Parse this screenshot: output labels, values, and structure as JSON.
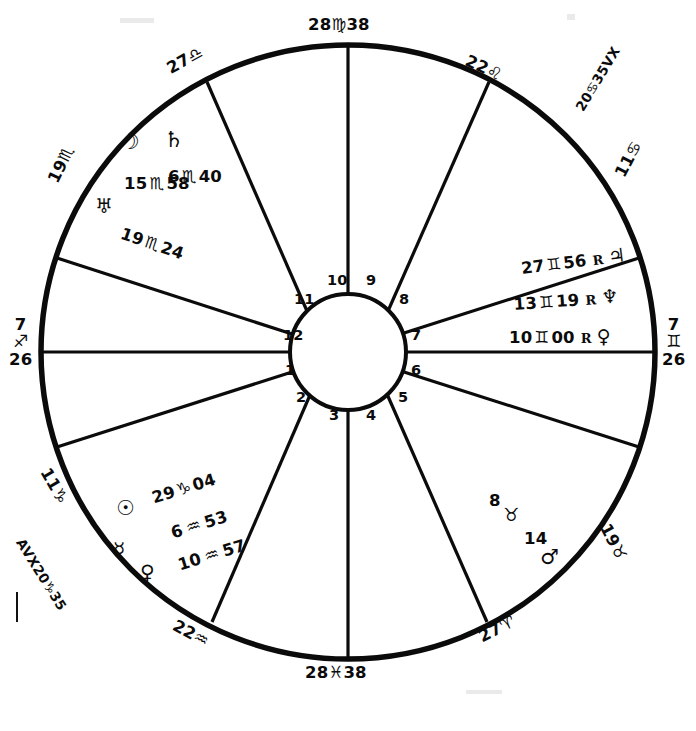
{
  "chart": {
    "type": "astrological-chart",
    "cusps": {
      "mc": {
        "text": "28♏38",
        "degree": "28",
        "sign": "♍",
        "minute": "38",
        "name": "midheaven"
      },
      "ic": {
        "text": "28♓ 38",
        "degree": "28",
        "sign": "♓",
        "minute": "38",
        "name": "imum-coeli"
      },
      "asc": {
        "degree": "7",
        "sign": "♐",
        "minute": "26",
        "name": "ascendant"
      },
      "dsc": {
        "degree": "7",
        "sign": "♊",
        "minute": "26",
        "name": "descendant"
      },
      "c11": {
        "degree": "27",
        "sign": "♎",
        "name": "cusp-11"
      },
      "c10": {
        "degree": "22",
        "sign": "♌",
        "name": "cusp-10-leo"
      },
      "c9": {
        "degree": "11",
        "sign": "♋",
        "name": "cusp-9"
      },
      "c8": {
        "degree": "19",
        "sign": "♉",
        "name": "cusp-8"
      },
      "c7": {
        "degree": "27",
        "sign": "♈",
        "name": "cusp-7"
      },
      "c6": {
        "degree": "22",
        "sign": "♒",
        "name": "cusp-6"
      },
      "c5": {
        "degree": "11",
        "sign": "♑",
        "name": "cusp-5"
      },
      "c4": {
        "degree": "19",
        "sign": "♏",
        "name": "cusp-4"
      },
      "c3": {
        "degree": "19",
        "sign": "♏",
        "name": "cusp-3"
      }
    },
    "vertex": {
      "upper": {
        "text": "20♋35 VX",
        "degree": "20",
        "sign": "♋",
        "minute": "35",
        "suffix": "VX"
      },
      "lower": {
        "text": "AVX20♑ 35",
        "prefix": "AVX",
        "degree": "20",
        "sign": "♑",
        "minute": "35"
      }
    },
    "houses": [
      "1",
      "2",
      "3",
      "4",
      "5",
      "6",
      "7",
      "8",
      "9",
      "10",
      "11",
      "12"
    ],
    "planet_groups": {
      "scorpio_group": {
        "name": "moon-saturn-group",
        "symbols": [
          "☽",
          "♄"
        ],
        "rows": [
          {
            "degree": "15",
            "sign": "♏",
            "minute": "58"
          },
          {
            "degree": "6",
            "sign": "♏",
            "minute": "40"
          }
        ],
        "uranus": {
          "symbol": "♅",
          "degree": "19",
          "sign": "♏",
          "minute": "24"
        }
      },
      "gemini_group": {
        "name": "jupiter-neptune-pluto-group",
        "rows": [
          {
            "degree": "27",
            "sign": "♊",
            "minute": "56",
            "retro": "R",
            "symbol": "♃",
            "planet": "jupiter"
          },
          {
            "degree": "13",
            "sign": "♊",
            "minute": "19",
            "retro": "R",
            "symbol": "♆",
            "planet": "neptune"
          },
          {
            "degree": "10",
            "sign": "♊",
            "minute": "00",
            "retro": "R",
            "symbol": "♀",
            "planet": "pluto"
          }
        ]
      },
      "capricorn_group": {
        "name": "sun-mercury-venus-group",
        "symbols": [
          "☉",
          "☿",
          "♀"
        ],
        "rows": [
          {
            "degree": "29",
            "sign": "♑",
            "minute": "04",
            "planet": "sun"
          },
          {
            "degree": "6",
            "sign": "♒",
            "minute": "53",
            "planet": "mercury"
          },
          {
            "degree": "10",
            "sign": "♒",
            "minute": "57",
            "planet": "venus"
          }
        ]
      },
      "taurus_group": {
        "name": "mars-group",
        "symbol": "♂",
        "row": {
          "degree": "8",
          "sign": "♉",
          "minute": "14",
          "planet": "mars"
        }
      }
    },
    "colors": {
      "ink": "#0b0b0b",
      "background": "#ffffff"
    }
  }
}
